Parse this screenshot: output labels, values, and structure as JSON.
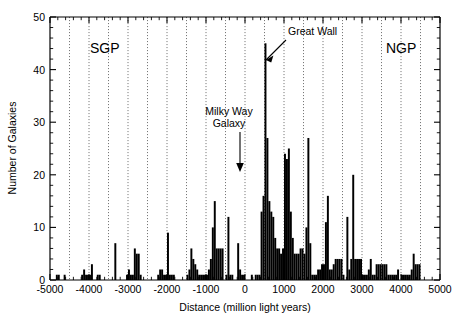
{
  "chart_data": {
    "type": "bar",
    "title": "",
    "subtitle": "",
    "xlabel": "Distance (million light years)",
    "ylabel": "Number of Galaxies",
    "xlim": [
      -5000,
      5000
    ],
    "ylim": [
      0,
      50
    ],
    "bin_width": 50,
    "grid": "vertical dotted gridlines every 500 million light years",
    "legend": "none",
    "x_major_ticks": [
      -5000,
      -4000,
      -3000,
      -2000,
      -1000,
      0,
      1000,
      2000,
      3000,
      4000,
      5000
    ],
    "x_major_tick_labels": [
      "-5000",
      "-4000",
      "-3000",
      "-2000",
      "-1000",
      "0",
      "1000",
      "2000",
      "3000",
      "4000",
      "5000"
    ],
    "x_minor_tick_step": 200,
    "y_major_ticks": [
      0,
      10,
      20,
      30,
      40,
      50
    ],
    "y_major_tick_labels": [
      "0",
      "10",
      "20",
      "30",
      "40",
      "50"
    ],
    "y_minor_tick_step": 2,
    "annotations": [
      {
        "name": "sgp-label",
        "text": "SGP",
        "x": -4250,
        "y": 46.0
      },
      {
        "name": "ngp-label",
        "text": "NGP",
        "x": 4150,
        "y": 46.0
      },
      {
        "name": "great-wall-label",
        "text": "Great Wall",
        "x": 900,
        "y": 46.5
      },
      {
        "name": "milky-way-label-line1",
        "text": "Milky Way",
        "x": -500,
        "y": 32.5
      },
      {
        "name": "milky-way-label-line2",
        "text": "Galaxy",
        "x": -500,
        "y": 29.8
      }
    ],
    "bins_start": -5000,
    "values": [
      0,
      0,
      0,
      1,
      1,
      0,
      0,
      1,
      0,
      0,
      0,
      0,
      0,
      0,
      0,
      0,
      1,
      2,
      1,
      1,
      1,
      3,
      0,
      0,
      1,
      1,
      0,
      0,
      0,
      0,
      0,
      0,
      0,
      7,
      0,
      0,
      0,
      0,
      0,
      1,
      2,
      1,
      1,
      6,
      5,
      5,
      1,
      0,
      0,
      0,
      0,
      0,
      0,
      0,
      0,
      1,
      2,
      2,
      1,
      1,
      9,
      1,
      1,
      1,
      0,
      0,
      0,
      0,
      0,
      0,
      1,
      2,
      6,
      4,
      3,
      2,
      1,
      1,
      1,
      1,
      1,
      2,
      4,
      10,
      15,
      6,
      6,
      6,
      6,
      0,
      1,
      12,
      1,
      1,
      0,
      0,
      7,
      2,
      1,
      1,
      0,
      0,
      0,
      1,
      0,
      1,
      1,
      1,
      13,
      16,
      45,
      27,
      15,
      13,
      12,
      8,
      6,
      6,
      5,
      6,
      24,
      23,
      25,
      13,
      8,
      5,
      5,
      5,
      6,
      6,
      5,
      10,
      27,
      7,
      1,
      1,
      1,
      2,
      2,
      3,
      3,
      11,
      16,
      2,
      2,
      3,
      4,
      4,
      4,
      4,
      1,
      0,
      12,
      2,
      4,
      20,
      4,
      4,
      4,
      4,
      1,
      1,
      1,
      2,
      4,
      1,
      1,
      3,
      3,
      3,
      3,
      3,
      3,
      1,
      1,
      1,
      1,
      1,
      2,
      0,
      1,
      1,
      1,
      1,
      1,
      2,
      5,
      3,
      3,
      3,
      0,
      0
    ]
  },
  "figure": {
    "caption": "",
    "plot_area": {
      "left": 50,
      "top": 17,
      "right": 440,
      "bottom": 280
    }
  }
}
